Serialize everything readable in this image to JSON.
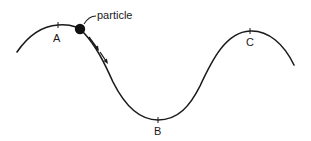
{
  "diagram": {
    "type": "particle-on-wavy-track",
    "background": "#ffffff",
    "stroke_color": "#1a1a1a",
    "particle": {
      "label": "particle",
      "color": "#111111"
    },
    "points": [
      {
        "id": "A",
        "label": "A",
        "kind": "crest"
      },
      {
        "id": "B",
        "label": "B",
        "kind": "trough"
      },
      {
        "id": "C",
        "label": "C",
        "kind": "crest"
      }
    ],
    "motion_arrows": {
      "count": 2,
      "direction": "downhill-toward-B"
    }
  }
}
